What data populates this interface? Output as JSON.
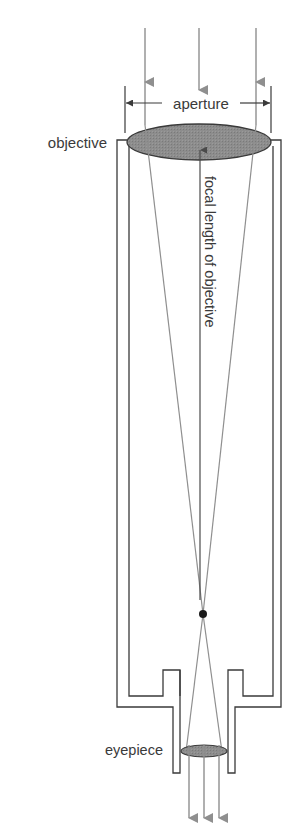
{
  "diagram": {
    "type": "refracting-telescope",
    "labels": {
      "objective": "objective",
      "aperture": "aperture",
      "focal_length": "focal length of objective",
      "eyepiece": "eyepiece"
    },
    "colors": {
      "lens_fill": "#8a8a8a",
      "ray": "#8f8f8f",
      "outline": "#3a3a3a",
      "focal_point": "#1a1a1a"
    },
    "rays_in": 3,
    "rays_out": 3
  }
}
